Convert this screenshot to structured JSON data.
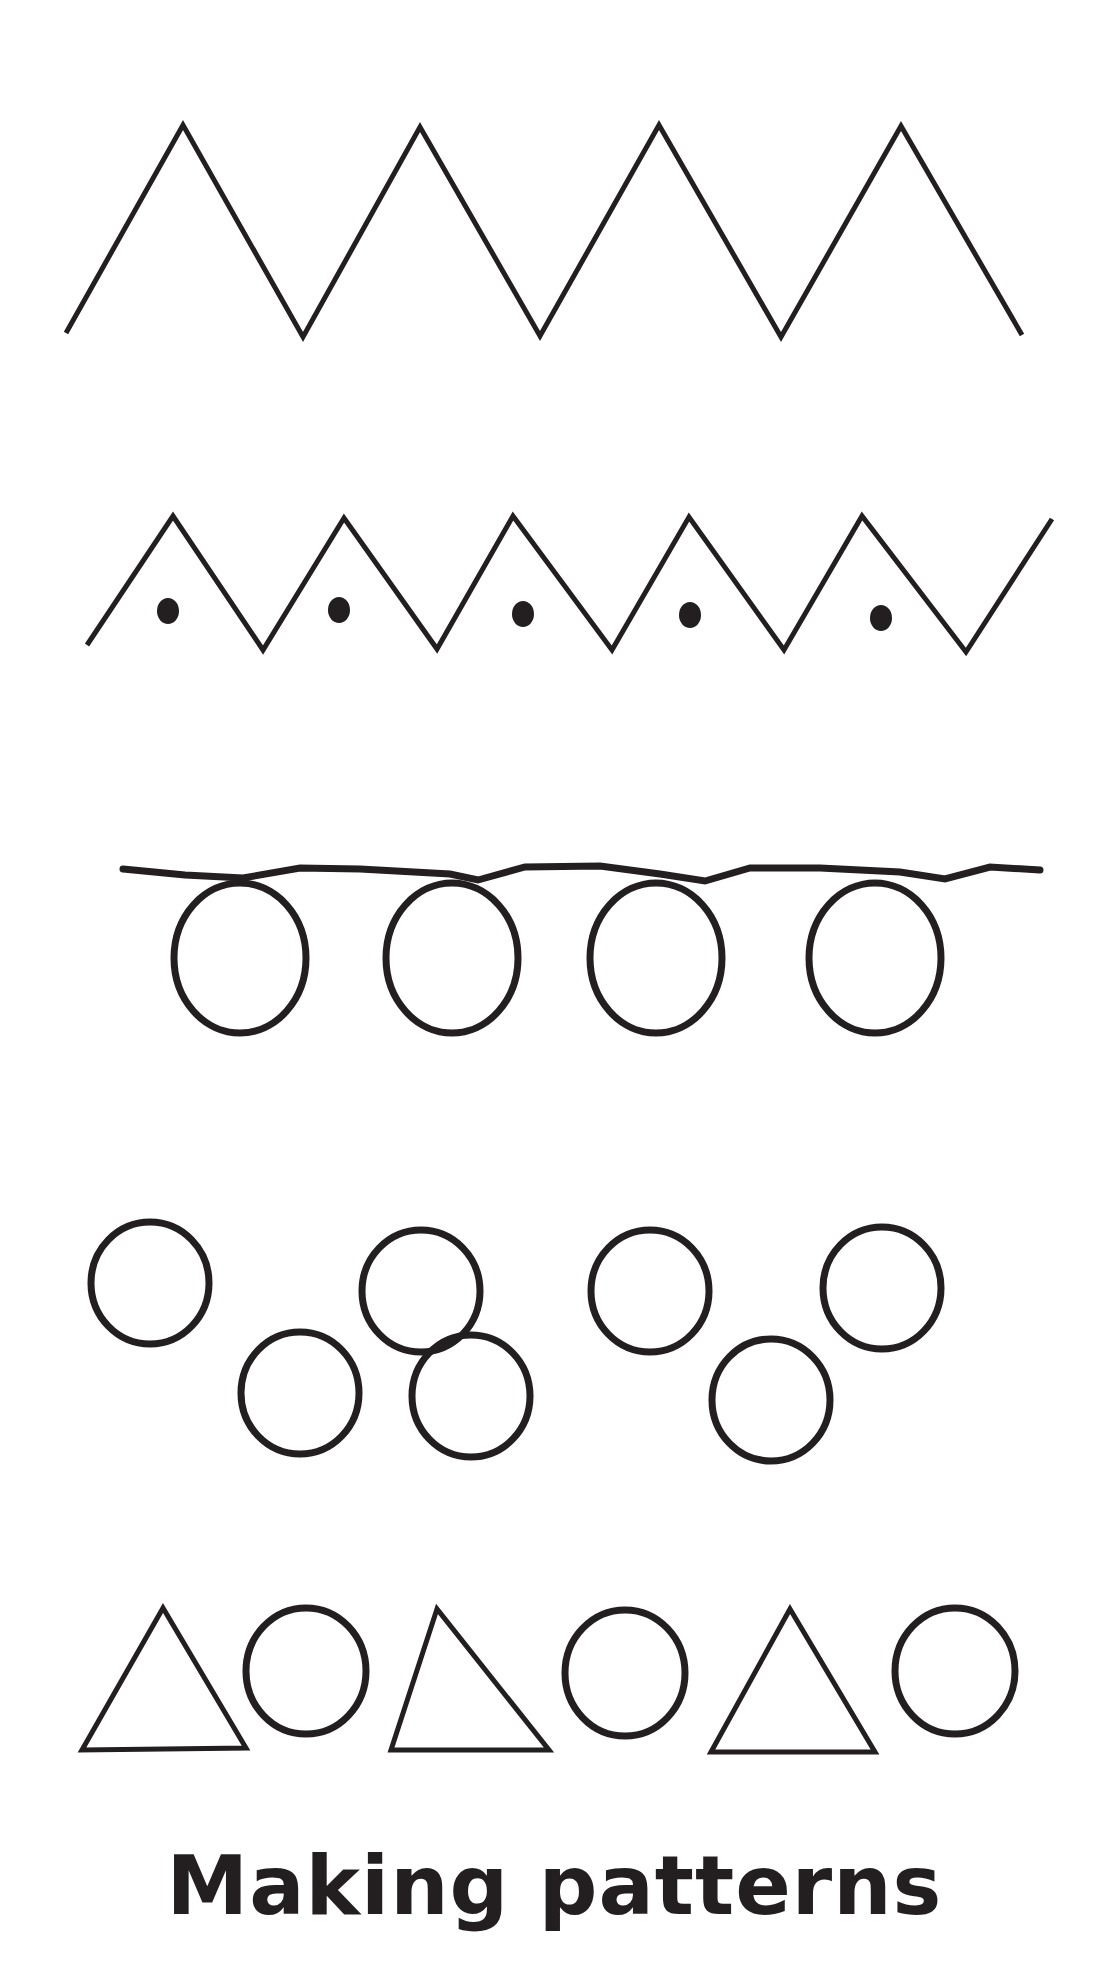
{
  "worksheet": {
    "title": "Making patterns",
    "ink_color": "#231f20",
    "background": "#ffffff",
    "rows": [
      {
        "name": "large-zigzag",
        "points": [
          [
            66,
            333
          ],
          [
            183,
            125
          ],
          [
            303,
            337
          ],
          [
            420,
            127
          ],
          [
            540,
            336
          ],
          [
            659,
            125
          ],
          [
            781,
            337
          ],
          [
            901,
            126
          ],
          [
            1022,
            335
          ]
        ]
      },
      {
        "name": "zigzag-with-dots",
        "points": [
          [
            87,
            645
          ],
          [
            173,
            516
          ],
          [
            263,
            650
          ],
          [
            344,
            518
          ],
          [
            437,
            649
          ],
          [
            513,
            516
          ],
          [
            612,
            650
          ],
          [
            689,
            517
          ],
          [
            784,
            650
          ],
          [
            862,
            516
          ],
          [
            966,
            652
          ],
          [
            1052,
            519
          ]
        ],
        "dots": [
          [
            168,
            611
          ],
          [
            339,
            610
          ],
          [
            523,
            614
          ],
          [
            690,
            615
          ],
          [
            881,
            618
          ]
        ]
      },
      {
        "name": "loop-chain",
        "line": [
          [
            123,
            869
          ],
          [
            185,
            875
          ],
          [
            243,
            878
          ],
          [
            300,
            868
          ],
          [
            360,
            869
          ],
          [
            450,
            874
          ],
          [
            478,
            880
          ],
          [
            525,
            867
          ],
          [
            600,
            866
          ],
          [
            660,
            874
          ],
          [
            705,
            881
          ],
          [
            750,
            868
          ],
          [
            820,
            868
          ],
          [
            900,
            872
          ],
          [
            945,
            879
          ],
          [
            990,
            867
          ],
          [
            1040,
            870
          ]
        ],
        "loops": [
          {
            "cx": 240,
            "cy": 958,
            "rx": 66,
            "ry": 75
          },
          {
            "cx": 452,
            "cy": 958,
            "rx": 66,
            "ry": 75
          },
          {
            "cx": 656,
            "cy": 958,
            "rx": 66,
            "ry": 75
          },
          {
            "cx": 875,
            "cy": 958,
            "rx": 66,
            "ry": 75
          }
        ]
      },
      {
        "name": "staggered-circles",
        "circles": [
          {
            "cx": 150,
            "cy": 1283,
            "rx": 59,
            "ry": 61
          },
          {
            "cx": 300,
            "cy": 1393,
            "rx": 59,
            "ry": 61
          },
          {
            "cx": 421,
            "cy": 1291,
            "rx": 59,
            "ry": 61
          },
          {
            "cx": 471,
            "cy": 1396,
            "rx": 59,
            "ry": 61
          },
          {
            "cx": 650,
            "cy": 1291,
            "rx": 59,
            "ry": 61
          },
          {
            "cx": 771,
            "cy": 1400,
            "rx": 59,
            "ry": 61
          },
          {
            "cx": 882,
            "cy": 1288,
            "rx": 59,
            "ry": 61
          }
        ]
      },
      {
        "name": "triangle-circle-sequence",
        "triangles": [
          [
            [
              114,
              1606
            ],
            [
              80,
              1745
            ],
            [
              175,
              1745
            ]
          ],
          [
            [
              277,
              1607
            ],
            [
              238,
              1747
            ],
            [
              338,
              1747
            ]
          ],
          [
            [
              450,
              1608
            ],
            [
              412,
              1749
            ],
            [
              512,
              1749
            ]
          ]
        ],
        "triangles_px": [
          [
            [
              163,
              1608
            ],
            [
              82,
              1750
            ],
            [
              246,
              1748
            ]
          ],
          [
            [
              437,
              1609
            ],
            [
              391,
              1750
            ],
            [
              549,
              1750
            ]
          ],
          [
            [
              790,
              1609
            ],
            [
              711,
              1752
            ],
            [
              875,
              1752
            ]
          ]
        ],
        "circles": [
          {
            "cx": 306,
            "cy": 1671,
            "rx": 60,
            "ry": 63
          },
          {
            "cx": 625,
            "cy": 1673,
            "rx": 60,
            "ry": 63
          },
          {
            "cx": 955,
            "cy": 1671,
            "rx": 60,
            "ry": 63
          }
        ]
      }
    ]
  }
}
